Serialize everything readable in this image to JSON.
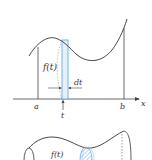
{
  "top_figure": {
    "curve_label": "f(t)",
    "width_label": "dt",
    "axis_label": "x",
    "left_bound": "a",
    "right_bound": "b",
    "point_label": "t"
  },
  "bottom_figure": {
    "radius_label": "f(t)"
  },
  "colors": {
    "line": "#333333",
    "strip": "#6aaee0",
    "strip_fill": "#d6ebf8"
  }
}
